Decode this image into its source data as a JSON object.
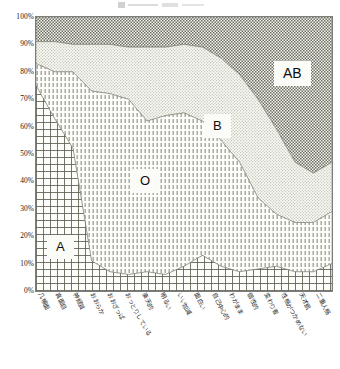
{
  "chart": {
    "title": "",
    "y_axis": {
      "ticks": [
        "100%",
        "90%",
        "80%",
        "70%",
        "60%",
        "50%",
        "40%",
        "30%",
        "20%",
        "10%",
        "0%"
      ],
      "min": 0,
      "max": 100
    },
    "region_labels": {
      "a": "A",
      "o": "O",
      "b": "B",
      "ab": "AB"
    }
  },
  "chart_data": {
    "type": "area",
    "title": "",
    "xlabel": "",
    "ylabel": "",
    "ylim": [
      0,
      100
    ],
    "grid": false,
    "legend_position": "inline-region-labels",
    "stacked": true,
    "percent": true,
    "categories": [
      "几帳面",
      "真面目",
      "神経質",
      "おおらか",
      "おおざっぱ",
      "おっとりしている",
      "楽天的",
      "明るい",
      "いい加減",
      "面白い",
      "自己中心的",
      "わがまま",
      "個性的",
      "変わり者",
      "性格がつかめない",
      "天才肌",
      "二重人格"
    ],
    "series": [
      {
        "name": "A",
        "fill_pattern": "cross-hatch-grid",
        "values": [
          75,
          63,
          52,
          11,
          7,
          6,
          7,
          6,
          9,
          13,
          9,
          7,
          8,
          9,
          7,
          7,
          10
        ]
      },
      {
        "name": "O",
        "fill_pattern": "vertical-dashes",
        "values": [
          8,
          17,
          28,
          62,
          65,
          64,
          55,
          58,
          56,
          49,
          46,
          40,
          26,
          19,
          18,
          18,
          19
        ]
      },
      {
        "name": "B",
        "fill_pattern": "light-checker",
        "values": [
          8,
          11,
          10,
          17,
          18,
          19,
          27,
          25,
          25,
          27,
          30,
          32,
          36,
          31,
          22,
          18,
          18
        ]
      },
      {
        "name": "AB",
        "fill_pattern": "dense-dark-checker",
        "values": [
          9,
          9,
          10,
          10,
          10,
          11,
          11,
          11,
          10,
          11,
          15,
          21,
          30,
          41,
          53,
          57,
          53
        ]
      }
    ]
  }
}
